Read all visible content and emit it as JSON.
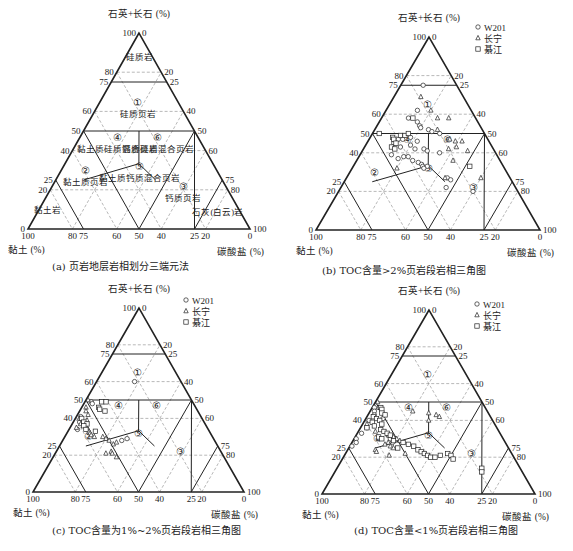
{
  "figure": {
    "panels": [
      {
        "id": "a",
        "caption": "(a) 页岩地层岩相划分三端元法",
        "caption_pos": [
          52,
          264
        ],
        "geom": {
          "apex": [
            139,
            33
          ],
          "bl": [
            28,
            229
          ],
          "br": [
            250,
            229
          ]
        },
        "show_legend": false,
        "show_region_names": true
      },
      {
        "id": "b",
        "caption": "(b) TOC含量>2%页岩段岩相三角图",
        "caption_pos": [
          322,
          268
        ],
        "geom": {
          "apex": [
            429,
            37
          ],
          "bl": [
            316,
            230
          ],
          "br": [
            540,
            230
          ]
        },
        "show_legend": true,
        "legend_pos": [
          478,
          27
        ]
      },
      {
        "id": "c",
        "caption": "(c) TOC含量为1%~2%页岩段岩相三角图",
        "caption_pos": [
          52,
          528
        ],
        "geom": {
          "apex": [
            139,
            308
          ],
          "bl": [
            33,
            492
          ],
          "br": [
            244,
            492
          ]
        },
        "show_legend": true,
        "legend_pos": [
          186,
          300
        ]
      },
      {
        "id": "d",
        "caption": "(d) TOC含量<1%页岩段岩相三角图",
        "caption_pos": [
          354,
          528
        ],
        "geom": {
          "apex": [
            429,
            310
          ],
          "bl": [
            322,
            494
          ],
          "br": [
            535,
            494
          ]
        },
        "show_legend": true,
        "legend_pos": [
          477,
          304
        ]
      }
    ],
    "axis_titles": {
      "top": "石英+长石 (%)",
      "left": "黏土 (%)",
      "right": "碳酸盐 (%)"
    },
    "left_edge_ticks": [
      "100",
      "80",
      "75",
      "60",
      "50",
      "40",
      "25",
      "20",
      "0"
    ],
    "right_edge_ticks": [
      "0",
      "20",
      "25",
      "40",
      "50",
      "60",
      "75",
      "80",
      "100"
    ],
    "bottom_ticks": [
      "100",
      "80",
      "75",
      "60",
      "50",
      "40",
      "25",
      "20",
      "0"
    ],
    "legend": [
      {
        "symbol": "circle",
        "label": "W201"
      },
      {
        "symbol": "triangle",
        "label": "长宁"
      },
      {
        "symbol": "square",
        "label": "綦江"
      }
    ],
    "colors": {
      "line": "#222222",
      "dash": "#888888",
      "text": "#222222",
      "bg": "#ffffff"
    }
  },
  "chart_data": {
    "type": "scatter",
    "subtype": "ternary",
    "axes": {
      "top": {
        "label": "石英+长石 (%)",
        "range": [
          0,
          100
        ]
      },
      "left": {
        "label": "黏土 (%)",
        "range": [
          0,
          100
        ]
      },
      "right": {
        "label": "碳酸盐 (%)",
        "range": [
          0,
          100
        ]
      }
    },
    "grid": {
      "dashed_quartz_levels": [
        80,
        60,
        40,
        20
      ],
      "solid_quartz_levels": [
        75,
        50
      ],
      "dashed_clay_levels": [
        80,
        60,
        40,
        20
      ],
      "dashed_carbonate_levels": [
        80,
        60,
        40,
        20
      ]
    },
    "regions": [
      {
        "id": "①",
        "name": "硅质页岩",
        "pos": {
          "q": 63,
          "c": 18
        }
      },
      {
        "id": "②",
        "name": "黏土质页岩",
        "pos": {
          "q": 28,
          "c": 12
        }
      },
      {
        "id": "③",
        "name": "钙质页岩",
        "pos": {
          "q": 20,
          "c": 60
        }
      },
      {
        "id": "④",
        "name": "黏土质硅质混合页岩",
        "pos": {
          "q": 45,
          "c": 18
        }
      },
      {
        "id": "⑤",
        "name": "黏土质钙质混合页岩",
        "pos": {
          "q": 30,
          "c": 35
        }
      },
      {
        "id": "⑥",
        "name": "钙质硅质混合页岩",
        "pos": {
          "q": 45,
          "c": 36
        }
      },
      {
        "id": "top",
        "name": "硅质岩",
        "pos": {
          "q": 86,
          "c": 7
        }
      },
      {
        "id": "clay",
        "name": "黏土岩",
        "pos": {
          "q": 8,
          "c": 5
        }
      },
      {
        "id": "lime",
        "name": "石灰(白云)岩",
        "pos": {
          "q": 7,
          "c": 82
        }
      }
    ],
    "series": {
      "b": [
        {
          "name": "W201",
          "points": [
            [
              75,
              10
            ],
            [
              62,
              14
            ],
            [
              58,
              12
            ],
            [
              56,
              17
            ],
            [
              54,
              19
            ],
            [
              53,
              20
            ],
            [
              52,
              24
            ],
            [
              51,
              26
            ],
            [
              50,
              30
            ],
            [
              48,
              18
            ],
            [
              47,
              13
            ],
            [
              47,
              15
            ],
            [
              46,
              22
            ],
            [
              45,
              12
            ],
            [
              44,
              20
            ],
            [
              43,
              16
            ],
            [
              42,
              23
            ],
            [
              42,
              27
            ],
            [
              41,
              29
            ],
            [
              40,
              35
            ],
            [
              39,
              14
            ],
            [
              38,
              20
            ],
            [
              38,
              22
            ],
            [
              37,
              18
            ],
            [
              36,
              25
            ],
            [
              35,
              28
            ],
            [
              34,
              30
            ],
            [
              33,
              31
            ],
            [
              33,
              33
            ],
            [
              32,
              32
            ],
            [
              27,
              45
            ],
            [
              26,
              47
            ],
            [
              22,
              47
            ],
            [
              20,
              60
            ]
          ]
        },
        {
          "name": "长宁",
          "points": [
            [
              69,
              12
            ],
            [
              62,
              20
            ],
            [
              58,
              25
            ],
            [
              58,
              30
            ],
            [
              52,
              28
            ],
            [
              47,
              36
            ],
            [
              46,
              39
            ],
            [
              46,
              42
            ],
            [
              43,
              41
            ],
            [
              42,
              38
            ],
            [
              41,
              47
            ],
            [
              36,
              43
            ],
            [
              32,
              20
            ],
            [
              27,
              44
            ],
            [
              27,
              60
            ]
          ]
        },
        {
          "name": "綦江",
          "points": [
            [
              58,
              14
            ],
            [
              50,
              3
            ],
            [
              48,
              10
            ],
            [
              49,
              13
            ],
            [
              49,
              15
            ],
            [
              50,
              16
            ],
            [
              47,
              11
            ],
            [
              45,
              13
            ],
            [
              43,
              12
            ],
            [
              42,
              14
            ],
            [
              33,
              52
            ]
          ]
        }
      ],
      "c": [
        {
          "name": "W201",
          "points": [
            [
              60,
              18
            ],
            [
              49,
              3
            ],
            [
              48,
              4
            ],
            [
              41,
              2
            ],
            [
              38,
              3
            ],
            [
              34,
              4
            ],
            [
              29,
              30
            ],
            [
              28,
              28
            ]
          ]
        },
        {
          "name": "长宁",
          "points": [
            [
              50,
              1
            ],
            [
              46,
              2
            ],
            [
              44,
              3
            ],
            [
              42,
              5
            ],
            [
              40,
              2
            ],
            [
              39,
              6
            ],
            [
              37,
              4
            ],
            [
              36,
              7
            ],
            [
              35,
              3
            ],
            [
              34,
              9
            ],
            [
              33,
              10
            ],
            [
              32,
              11
            ],
            [
              31,
              12
            ],
            [
              30,
              14
            ],
            [
              30,
              18
            ],
            [
              29,
              20
            ],
            [
              28,
              22
            ],
            [
              27,
              26
            ],
            [
              26,
              25
            ],
            [
              22,
              26
            ],
            [
              21,
              24
            ],
            [
              21,
              27
            ],
            [
              19,
              30
            ]
          ]
        },
        {
          "name": "綦江",
          "points": [
            [
              49,
              8
            ],
            [
              49,
              10
            ],
            [
              46,
              8
            ],
            [
              45,
              9
            ],
            [
              44,
              12
            ],
            [
              40,
              3
            ],
            [
              38,
              5
            ],
            [
              37,
              7
            ],
            [
              36,
              6
            ],
            [
              34,
              8
            ],
            [
              33,
              13
            ]
          ]
        }
      ],
      "d": [
        {
          "name": "W201",
          "points": [
            [
              47,
              1
            ],
            [
              45,
              2
            ],
            [
              43,
              3
            ],
            [
              40,
              2
            ],
            [
              36,
              3
            ],
            [
              33,
              2
            ],
            [
              30,
              1
            ],
            [
              28,
              2
            ],
            [
              26,
              1
            ],
            [
              41,
              8
            ],
            [
              32,
              15
            ],
            [
              30,
              17
            ],
            [
              28,
              19
            ]
          ]
        },
        {
          "name": "长宁",
          "points": [
            [
              50,
              1
            ],
            [
              47,
              3
            ],
            [
              45,
              20
            ],
            [
              44,
              28
            ],
            [
              43,
              32
            ],
            [
              42,
              34
            ],
            [
              40,
              30
            ],
            [
              38,
              2
            ],
            [
              34,
              8
            ],
            [
              32,
              15
            ],
            [
              31,
              18
            ],
            [
              30,
              20
            ],
            [
              29,
              22
            ],
            [
              28,
              17
            ],
            [
              27,
              16
            ],
            [
              26,
              19
            ],
            [
              25,
              21
            ],
            [
              24,
              13
            ],
            [
              23,
              14
            ],
            [
              22,
              28
            ],
            [
              21,
              21
            ]
          ]
        },
        {
          "name": "綦江",
          "points": [
            [
              47,
              4
            ],
            [
              46,
              5
            ],
            [
              44,
              6
            ],
            [
              43,
              8
            ],
            [
              42,
              3
            ],
            [
              41,
              5
            ],
            [
              40,
              7
            ],
            [
              39,
              4
            ],
            [
              38,
              9
            ],
            [
              37,
              6
            ],
            [
              36,
              3
            ],
            [
              35,
              10
            ],
            [
              34,
              12
            ],
            [
              33,
              14
            ],
            [
              32,
              16
            ],
            [
              31,
              11
            ],
            [
              30,
              13
            ],
            [
              29,
              19
            ],
            [
              28,
              24
            ],
            [
              27,
              27
            ],
            [
              26,
              30
            ],
            [
              25,
              23
            ],
            [
              24,
              33
            ],
            [
              23,
              35
            ],
            [
              22,
              37
            ],
            [
              21,
              39
            ],
            [
              20,
              41
            ],
            [
              20,
              43
            ],
            [
              21,
              45
            ],
            [
              22,
              48
            ],
            [
              21,
              50
            ],
            [
              19,
              52
            ],
            [
              14,
              68
            ],
            [
              12,
              69
            ]
          ]
        }
      ]
    }
  }
}
